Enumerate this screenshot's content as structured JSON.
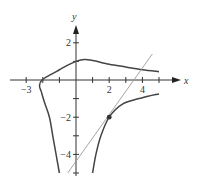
{
  "chart_data": {
    "type": "line",
    "title": "",
    "xlabel": "x",
    "ylabel": "y",
    "xlim": [
      -4,
      5
    ],
    "ylim": [
      -5.5,
      3.5
    ],
    "grid": false,
    "x_ticks": [
      -3,
      -2,
      -1,
      1,
      2,
      3,
      4,
      5
    ],
    "x_tick_labels": [
      {
        "value": -3,
        "label": "−3"
      },
      {
        "value": 2,
        "label": "2"
      },
      {
        "value": 4,
        "label": "4"
      }
    ],
    "y_ticks": [
      2,
      1,
      -1,
      -2,
      -3,
      -4,
      -5
    ],
    "y_tick_labels": [
      {
        "value": 2,
        "label": "2"
      },
      {
        "value": -2,
        "label": "−2"
      },
      {
        "value": -4,
        "label": "−4"
      }
    ],
    "series": [
      {
        "name": "curve-upper-branch",
        "color": "#444444",
        "points": [
          [
            -2.1,
            -0.6
          ],
          [
            -2.2,
            -0.3
          ],
          [
            -2.05,
            0.0
          ],
          [
            -1.5,
            0.3
          ],
          [
            -1.0,
            0.55
          ],
          [
            -0.5,
            0.8
          ],
          [
            0.0,
            1.0
          ],
          [
            0.5,
            1.1
          ],
          [
            1.0,
            1.05
          ],
          [
            2.0,
            0.85
          ],
          [
            3.0,
            0.7
          ],
          [
            4.0,
            0.55
          ],
          [
            5.0,
            0.45
          ]
        ]
      },
      {
        "name": "curve-left-lower-branch",
        "color": "#444444",
        "points": [
          [
            -2.1,
            -0.6
          ],
          [
            -1.9,
            -1.2
          ],
          [
            -1.6,
            -2.0
          ],
          [
            -1.4,
            -3.0
          ],
          [
            -1.2,
            -4.0
          ],
          [
            -1.0,
            -5.0
          ]
        ]
      },
      {
        "name": "curve-right-lower-branch",
        "color": "#444444",
        "points": [
          [
            1.0,
            -5.0
          ],
          [
            1.2,
            -4.0
          ],
          [
            1.5,
            -3.0
          ],
          [
            2.0,
            -2.0
          ],
          [
            2.8,
            -1.3
          ],
          [
            4.0,
            -0.95
          ],
          [
            5.0,
            -0.75
          ]
        ]
      },
      {
        "name": "tangent-line",
        "color": "#999999",
        "points": [
          [
            -0.5,
            -5.0
          ],
          [
            4.6,
            1.4
          ]
        ]
      }
    ],
    "annotations": [
      {
        "type": "point",
        "x": 2,
        "y": -2,
        "label": ""
      }
    ]
  }
}
